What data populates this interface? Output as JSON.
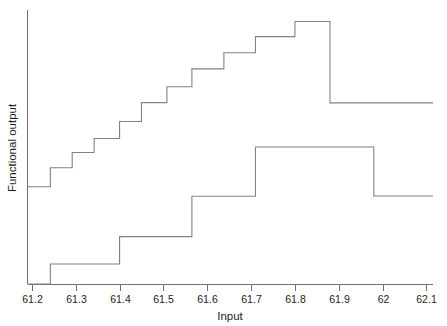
{
  "chart_data": {
    "type": "line",
    "subtype": "step-post",
    "title": "",
    "xlabel": "Input",
    "ylabel": "Functional output",
    "xlim": [
      61.19,
      62.115
    ],
    "ylim": [
      0,
      1
    ],
    "grid": false,
    "legend": null,
    "x_ticks": [
      61.2,
      61.3,
      61.4,
      61.5,
      61.6,
      61.7,
      61.8,
      61.9,
      62,
      62.1
    ],
    "x_tick_labels": [
      "61.2",
      "61.3",
      "61.4",
      "61.5",
      "61.6",
      "61.7",
      "61.8",
      "61.9",
      "62",
      "62.1"
    ],
    "y_ticks": [],
    "y_tick_labels": [],
    "series": [
      {
        "name": "upper-step-curve",
        "color": "#808285",
        "x": [
          61.19,
          61.242,
          61.242,
          61.292,
          61.292,
          61.342,
          61.342,
          61.4,
          61.4,
          61.45,
          61.45,
          61.508,
          61.508,
          61.565,
          61.565,
          61.638,
          61.638,
          61.71,
          61.71,
          61.8,
          61.8,
          61.88,
          61.88,
          62.115
        ],
        "y": [
          0.355,
          0.355,
          0.424,
          0.424,
          0.48,
          0.48,
          0.531,
          0.531,
          0.593,
          0.593,
          0.662,
          0.662,
          0.72,
          0.72,
          0.785,
          0.785,
          0.844,
          0.844,
          0.903,
          0.903,
          0.958,
          0.958,
          0.661,
          0.661
        ]
      },
      {
        "name": "lower-step-curve",
        "color": "#808285",
        "x": [
          61.19,
          61.242,
          61.242,
          61.4,
          61.4,
          61.565,
          61.565,
          61.71,
          61.71,
          61.98,
          61.98,
          62.115
        ],
        "y": [
          0.0,
          0.0,
          0.073,
          0.073,
          0.173,
          0.173,
          0.32,
          0.32,
          0.5,
          0.5,
          0.321,
          0.321
        ]
      }
    ]
  },
  "labels": {
    "x_axis_title": "Input",
    "y_axis_title": "Functional output"
  },
  "colors": {
    "line": "#808285",
    "axis": "#6d6e71",
    "text": "#231f20",
    "background": "#ffffff"
  }
}
